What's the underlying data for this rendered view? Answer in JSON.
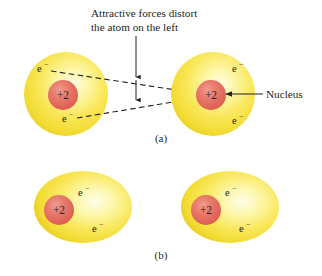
{
  "figure": {
    "title_annotation": {
      "line1": "Attractive forces distort",
      "line2": "the atom on the left"
    },
    "nucleus_callout": "Nucleus",
    "panel_labels": {
      "a": "(a)",
      "b": "(b)"
    },
    "colors": {
      "shell_core": "#fdf8c8",
      "shell_mid": "#f7e54a",
      "shell_edge": "#e8cf2a",
      "nucleus_fill": "#e2685c",
      "nucleus_highlight": "#ef8b7d",
      "line": "#231f20",
      "background": "#ffffff"
    },
    "panels": [
      {
        "id": "a",
        "label": "(a)",
        "description": "Two atoms, the left one distorted by attractive forces toward the right atom's nucleus",
        "atoms": [
          {
            "id": "a-left",
            "shape": "circle",
            "nucleus_label": "+2",
            "electrons": [
              {
                "symbol": "e",
                "charge": "−"
              },
              {
                "symbol": "e",
                "charge": "−"
              }
            ]
          },
          {
            "id": "a-right",
            "shape": "circle",
            "nucleus_label": "+2",
            "electrons": [
              {
                "symbol": "e",
                "charge": "−"
              },
              {
                "symbol": "e",
                "charge": "−"
              }
            ]
          }
        ]
      },
      {
        "id": "b",
        "label": "(b)",
        "description": "Two undistorted atoms drawn as ellipses",
        "atoms": [
          {
            "id": "b-left",
            "shape": "ellipse",
            "nucleus_label": "+2",
            "electrons": [
              {
                "symbol": "e",
                "charge": "−"
              },
              {
                "symbol": "e",
                "charge": "−"
              }
            ]
          },
          {
            "id": "b-right",
            "shape": "ellipse",
            "nucleus_label": "+2",
            "electrons": [
              {
                "symbol": "e",
                "charge": "−"
              },
              {
                "symbol": "e",
                "charge": "−"
              }
            ]
          }
        ]
      }
    ]
  }
}
